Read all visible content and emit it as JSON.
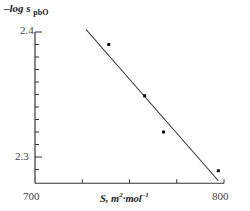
{
  "chart_data": {
    "type": "scatter",
    "title": "",
    "ylabel": "–log s",
    "ylabel_subscript": "pbO",
    "xlabel": "S, m²·mol⁻¹",
    "xlabel_parts": {
      "base": "S, m",
      "exp1": "2",
      "mid": "·mol",
      "exp2": "–1"
    },
    "xlim": [
      700,
      800
    ],
    "ylim": [
      2.279,
      2.4
    ],
    "x_ticks_major": [
      700,
      800
    ],
    "x_ticks_minor": [
      725,
      750,
      775
    ],
    "y_ticks_major": [
      2.3,
      2.4
    ],
    "y_ticks_minor": [
      2.29,
      2.31,
      2.32,
      2.33,
      2.34,
      2.35,
      2.36,
      2.37,
      2.38,
      2.39
    ],
    "x_tick_labels": [
      "700",
      "800"
    ],
    "y_tick_labels": [
      "2.3",
      "2.4"
    ],
    "grid": false,
    "legend": null,
    "series": [
      {
        "name": "measured",
        "kind": "points",
        "points": [
          {
            "x": 739,
            "y": 2.39
          },
          {
            "x": 758,
            "y": 2.349
          },
          {
            "x": 768,
            "y": 2.32
          },
          {
            "x": 797,
            "y": 2.289
          }
        ]
      },
      {
        "name": "linear fit",
        "kind": "line",
        "points": [
          {
            "x": 727,
            "y": 2.402
          },
          {
            "x": 797,
            "y": 2.281
          }
        ]
      }
    ]
  },
  "colors": {
    "axis": "#333333",
    "points": "#111111",
    "line": "#333333",
    "text": "#222222"
  }
}
